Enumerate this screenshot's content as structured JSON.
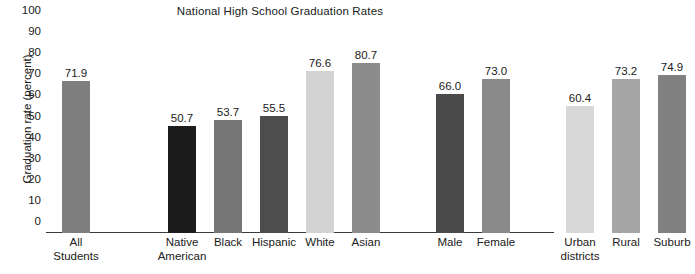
{
  "chart_data": {
    "type": "bar",
    "title": "National High School Graduation Rates",
    "xlabel": "",
    "ylabel": "Graduation rate (percent)",
    "ylim": [
      0,
      100
    ],
    "ytick_step": 10,
    "grid": false,
    "legend": "none",
    "yticks": [
      "100",
      "90",
      "80",
      "70",
      "60",
      "50",
      "40",
      "30",
      "20",
      "10",
      "0"
    ],
    "categories": [
      "All Students",
      "Native American",
      "Black",
      "Hispanic",
      "White",
      "Asian",
      "Male",
      "Female",
      "Urban districts",
      "Rural",
      "Suburb"
    ],
    "values": [
      71.9,
      50.7,
      53.7,
      55.5,
      76.6,
      80.7,
      66.0,
      73.0,
      60.4,
      73.2,
      74.9
    ],
    "value_labels": [
      "71.9",
      "50.7",
      "53.7",
      "55.5",
      "76.6",
      "80.7",
      "66.0",
      "73.0",
      "60.4",
      "73.2",
      "74.9"
    ],
    "bars": [
      {
        "label_line1": "All",
        "label_line2": "Students",
        "value": 71.9,
        "value_label": "71.9",
        "color": "#7f7f7f",
        "group": "overall"
      },
      {
        "label_line1": "Native",
        "label_line2": "American",
        "value": 50.7,
        "value_label": "50.7",
        "color": "#1c1c1c",
        "group": "race"
      },
      {
        "label_line1": "Black",
        "label_line2": "",
        "value": 53.7,
        "value_label": "53.7",
        "color": "#767676",
        "group": "race"
      },
      {
        "label_line1": "Hispanic",
        "label_line2": "",
        "value": 55.5,
        "value_label": "55.5",
        "color": "#4d4d4d",
        "group": "race"
      },
      {
        "label_line1": "White",
        "label_line2": "",
        "value": 76.6,
        "value_label": "76.6",
        "color": "#d3d3d3",
        "group": "race"
      },
      {
        "label_line1": "Asian",
        "label_line2": "",
        "value": 80.7,
        "value_label": "80.7",
        "color": "#8c8c8c",
        "group": "race"
      },
      {
        "label_line1": "Male",
        "label_line2": "",
        "value": 66.0,
        "value_label": "66.0",
        "color": "#4a4a4a",
        "group": "gender"
      },
      {
        "label_line1": "Female",
        "label_line2": "",
        "value": 73.0,
        "value_label": "73.0",
        "color": "#8a8a8a",
        "group": "gender"
      },
      {
        "label_line1": "Urban",
        "label_line2": "districts",
        "value": 60.4,
        "value_label": "60.4",
        "color": "#d8d8d8",
        "group": "locale"
      },
      {
        "label_line1": "Rural",
        "label_line2": "",
        "value": 73.2,
        "value_label": "73.2",
        "color": "#a6a6a6",
        "group": "locale"
      },
      {
        "label_line1": "Suburb",
        "label_line2": "",
        "value": 74.9,
        "value_label": "74.9",
        "color": "#808080",
        "group": "locale"
      }
    ],
    "colors": {
      "axis": "#3a3a3a",
      "text": "#202020",
      "background": "#ffffff"
    }
  }
}
